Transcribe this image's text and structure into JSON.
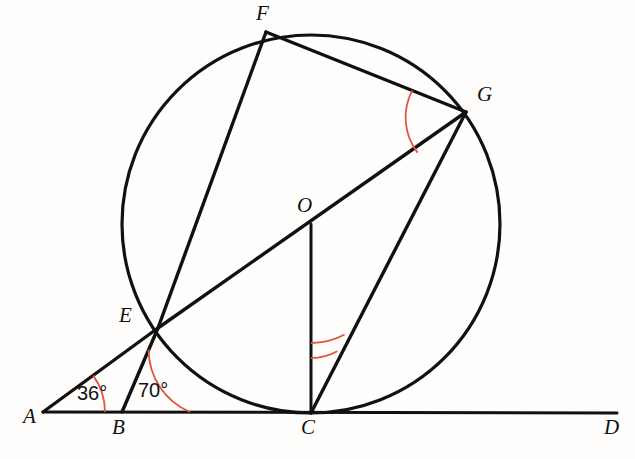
{
  "figure": {
    "background_color": "#fffefd",
    "stroke_color": "#111111",
    "arc_color": "#e0553f",
    "width": 635,
    "height": 459
  },
  "circle": {
    "center_label": "O",
    "cx": 311,
    "cy": 224,
    "r": 189,
    "stroke_width": 3.2
  },
  "points": {
    "A": {
      "label": "A",
      "x": 43,
      "y": 412,
      "label_x": 23,
      "label_y": 410
    },
    "B": {
      "label": "B",
      "x": 122,
      "y": 412,
      "label_x": 113,
      "label_y": 420
    },
    "C": {
      "label": "C",
      "x": 311,
      "y": 413,
      "label_x": 302,
      "label_y": 420
    },
    "D": {
      "label": "D",
      "x": 617,
      "y": 413,
      "label_x": 605,
      "label_y": 420
    },
    "E": {
      "label": "E",
      "x": 158,
      "y": 328,
      "label_x": 121,
      "label_y": 310
    },
    "F": {
      "label": "F",
      "x": 266,
      "y": 32,
      "label_x": 257,
      "label_y": 4
    },
    "G": {
      "label": "G",
      "x": 466,
      "y": 112,
      "label_x": 478,
      "label_y": 88
    },
    "O": {
      "label": "O",
      "x": 311,
      "y": 224,
      "label_x": 298,
      "label_y": 198
    }
  },
  "segments": [
    {
      "name": "line-AD",
      "from": "A",
      "to": "D",
      "stroke_width": 3.0
    },
    {
      "name": "chord-EF",
      "from": "E",
      "to": "F",
      "stroke_width": 3.4
    },
    {
      "name": "chord-FG",
      "from": "F",
      "to": "G",
      "stroke_width": 3.4
    },
    {
      "name": "chord-EG",
      "from": "E",
      "to": "G",
      "stroke_width": 3.4
    },
    {
      "name": "chord-GC",
      "from": "G",
      "to": "C",
      "stroke_width": 3.4
    },
    {
      "name": "radius-OC",
      "from": "O",
      "to": "C",
      "stroke_width": 3.0
    },
    {
      "name": "segment-AE",
      "from": "A",
      "to": "E",
      "stroke_width": 3.4
    },
    {
      "name": "segment-BE",
      "from": "B",
      "to": "E",
      "stroke_width": 3.4
    }
  ],
  "angles": [
    {
      "name": "angle-at-A",
      "vertex": "A",
      "value": "36°",
      "arcs": 1,
      "radius": 62,
      "label_x": 78,
      "label_y": 385
    },
    {
      "name": "angle-at-B",
      "vertex": "B",
      "value": "70°",
      "arcs": 1,
      "radius": 68,
      "label_x": 139,
      "label_y": 382
    },
    {
      "name": "angle-FGE",
      "vertex": "G",
      "value": "",
      "arcs": 1,
      "radius": 58,
      "label_x": 0,
      "label_y": 0
    },
    {
      "name": "angle-OCG",
      "vertex": "C",
      "value": "",
      "arcs": 2,
      "radius": 60,
      "label_x": 0,
      "label_y": 0
    }
  ]
}
